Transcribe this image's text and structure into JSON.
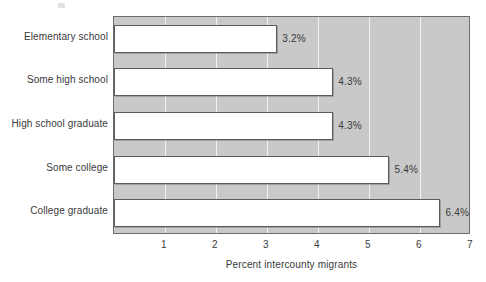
{
  "chart_data": {
    "type": "bar",
    "orientation": "horizontal",
    "title": "",
    "xlabel": "Percent intercounty migrants",
    "ylabel": "",
    "categories": [
      "Elementary school",
      "Some high school",
      "High school graduate",
      "Some college",
      "College graduate"
    ],
    "values": [
      3.2,
      4.3,
      4.3,
      5.4,
      6.4
    ],
    "data_labels": [
      "3.2%",
      "4.3%",
      "4.3%",
      "5.4%",
      "6.4%"
    ],
    "xlim": [
      0,
      7
    ],
    "xticks": [
      1,
      2,
      3,
      4,
      5,
      6,
      7
    ],
    "xtick_labels": [
      "1",
      "2",
      "3",
      "4",
      "5",
      "6",
      "7"
    ],
    "grid": "vertical",
    "legend": "none",
    "colors": {
      "bar_fill": "#ffffff",
      "bar_border": "#5c5c5c",
      "plot_background": "#c9c9c9",
      "gridline": "#f2f2f2",
      "axis_frame": "#6d6d6d",
      "text": "#3a3a3a",
      "page_background": "#ffffff"
    }
  }
}
